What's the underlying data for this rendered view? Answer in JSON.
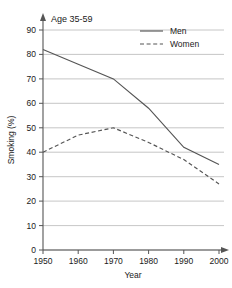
{
  "chart_data": {
    "type": "line",
    "title": "Age 35-59",
    "xlabel": "Year",
    "ylabel": "Smoking (%)",
    "xlim": [
      1950,
      2000
    ],
    "ylim": [
      0,
      90
    ],
    "grid": true,
    "legend_position": "top-right",
    "x_ticks": [
      "1950",
      "1960",
      "1970",
      "1980",
      "1990",
      "2000"
    ],
    "y_ticks": [
      "0",
      "10",
      "20",
      "30",
      "40",
      "50",
      "60",
      "70",
      "80",
      "90"
    ],
    "x": [
      1950,
      1960,
      1970,
      1980,
      1990,
      2000
    ],
    "series": [
      {
        "name": "Men",
        "style": "solid",
        "color": "#555555",
        "values": [
          82,
          76,
          70,
          58,
          42,
          35
        ]
      },
      {
        "name": "Women",
        "style": "dashed",
        "color": "#555555",
        "values": [
          40,
          47,
          50,
          44,
          37,
          27
        ]
      }
    ]
  },
  "legend": {
    "entries": [
      {
        "label": "Men"
      },
      {
        "label": "Women"
      }
    ]
  },
  "axes": {
    "y_tick_0": "0",
    "y_tick_10": "10",
    "y_tick_20": "20",
    "y_tick_30": "30",
    "y_tick_40": "40",
    "y_tick_50": "50",
    "y_tick_60": "60",
    "y_tick_70": "70",
    "y_tick_80": "80",
    "y_tick_90": "90",
    "x_tick_1950": "1950",
    "x_tick_1960": "1960",
    "x_tick_1970": "1970",
    "x_tick_1980": "1980",
    "x_tick_1990": "1990",
    "x_tick_2000": "2000"
  },
  "colors": {
    "line": "#555555",
    "grid": "#b8b8b8",
    "axis": "#555555",
    "text": "#1a1a1a"
  }
}
